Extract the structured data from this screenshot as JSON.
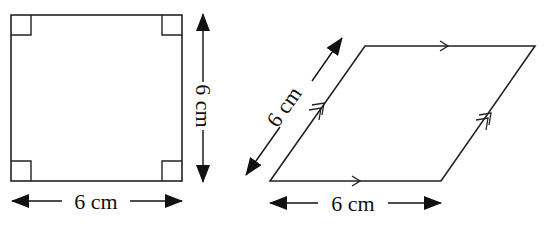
{
  "square": {
    "shape": "square",
    "side_horizontal_label": "6 cm",
    "side_vertical_label": "6 cm",
    "right_angle_markers": 4,
    "colors": {
      "stroke": "#222222"
    }
  },
  "parallelogram": {
    "shape": "rhombus",
    "base_label": "6 cm",
    "slant_label": "6 cm",
    "parallel_marks": {
      "horizontal_sides": "single-arrow",
      "slanted_sides": "double-arrow"
    },
    "colors": {
      "stroke": "#222222"
    }
  }
}
